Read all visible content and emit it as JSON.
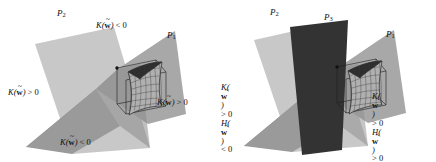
{
  "figure": {
    "type": "mathematical-diagram",
    "background_color": "#ffffff",
    "panels": [
      {
        "id": "left",
        "planes": [
          {
            "name": "P1",
            "label_prefix": "P",
            "label_sub": "1",
            "color": "#9b9b9b",
            "shape": "bowtie"
          },
          {
            "name": "P2",
            "label_prefix": "P",
            "label_sub": "2",
            "color": "#c6c6c6",
            "shape": "quadrilateral"
          }
        ],
        "plane_labels": [
          {
            "id": "p2",
            "prefix": "P",
            "sub": "2",
            "x": 57,
            "y": 10
          },
          {
            "id": "p1",
            "prefix": "P",
            "sub": "1",
            "x": 167,
            "y": 32
          }
        ],
        "curvature_labels": [
          {
            "id": "k-neg-top",
            "lines": [
              {
                "fn": "K",
                "arg": "w",
                "rel": "<",
                "val": "0"
              }
            ],
            "x": 96,
            "y": 22
          },
          {
            "id": "k-pos-left",
            "lines": [
              {
                "fn": "K",
                "arg": "w",
                "rel": ">",
                "val": "0"
              }
            ],
            "x": 8,
            "y": 89
          },
          {
            "id": "k-pos-right",
            "lines": [
              {
                "fn": "K",
                "arg": "w",
                "rel": ">",
                "val": "0"
              }
            ],
            "x": 157,
            "y": 99
          },
          {
            "id": "k-neg-bottom",
            "lines": [
              {
                "fn": "K",
                "arg": "w",
                "rel": "<",
                "val": "0"
              }
            ],
            "x": 60,
            "y": 139
          }
        ]
      },
      {
        "id": "right",
        "planes": [
          {
            "name": "P1",
            "label_prefix": "P",
            "label_sub": "1",
            "color": "#9b9b9b",
            "shape": "bowtie"
          },
          {
            "name": "P2",
            "label_prefix": "P",
            "label_sub": "2",
            "color": "#c6c6c6",
            "shape": "quadrilateral"
          },
          {
            "name": "P3",
            "label_prefix": "P",
            "label_sub": "3",
            "color": "#333333",
            "shape": "quadrilateral"
          }
        ],
        "plane_labels": [
          {
            "id": "p2",
            "prefix": "P",
            "sub": "2",
            "x": 52,
            "y": 9
          },
          {
            "id": "p3",
            "prefix": "P",
            "sub": "3",
            "x": 106,
            "y": 14
          },
          {
            "id": "p1",
            "prefix": "P",
            "sub": "1",
            "x": 168,
            "y": 31
          }
        ],
        "curvature_labels": [
          {
            "id": "kh-left",
            "lines": [
              {
                "fn": "K",
                "arg": "w",
                "rel": ">",
                "val": "0"
              },
              {
                "fn": "H",
                "arg": "w",
                "rel": "<",
                "val": "0"
              }
            ],
            "x": 3,
            "y": 84
          },
          {
            "id": "kh-right",
            "lines": [
              {
                "fn": "K",
                "arg": "w",
                "rel": ">",
                "val": "0"
              },
              {
                "fn": "H",
                "arg": "w",
                "rel": ">",
                "val": "0"
              }
            ],
            "x": 154,
            "y": 93
          }
        ]
      }
    ],
    "symbols": {
      "gaussian_curvature": "K",
      "mean_curvature": "H",
      "weight_vector": "w",
      "weight_accent": "tilde",
      "plane_symbol": "P"
    },
    "surface": {
      "name": "saddle-patch",
      "mesh_color": "#2a2a2a",
      "fill_color": "#b4b4b4",
      "box_color": "#1a1a1a"
    }
  }
}
